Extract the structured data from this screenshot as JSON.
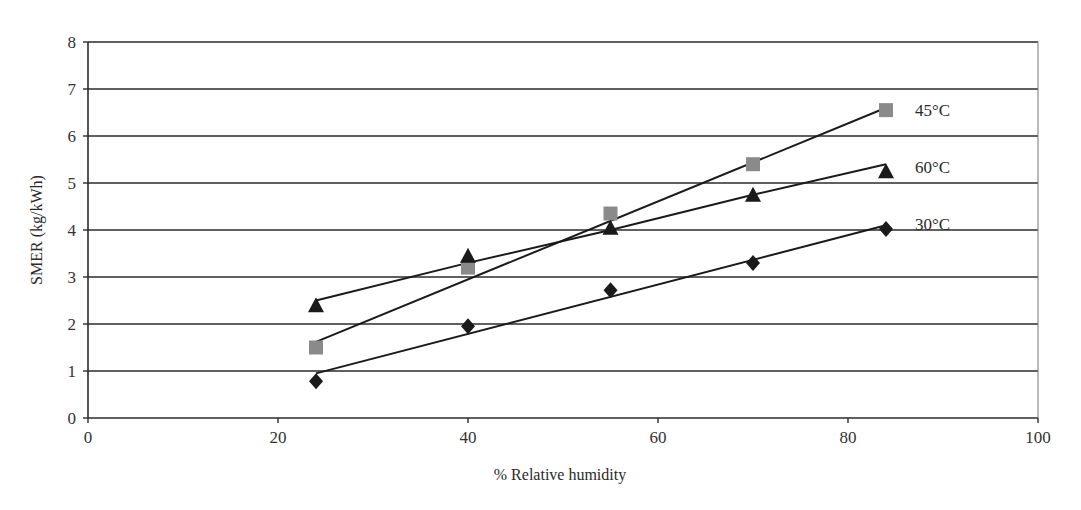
{
  "chart_data": {
    "type": "scatter",
    "title": "",
    "xlabel": "% Relative humidity",
    "ylabel": "SMER (kg/kWh)",
    "xlim": [
      0,
      100
    ],
    "ylim": [
      0,
      8
    ],
    "x_ticks": [
      0,
      20,
      40,
      60,
      80,
      100
    ],
    "y_ticks": [
      0,
      1,
      2,
      3,
      4,
      5,
      6,
      7,
      8
    ],
    "grid": "horizontal",
    "legend_position": "inline-right",
    "series": [
      {
        "name": "45°C",
        "marker": "square",
        "color": "#8a8a8a",
        "x": [
          24,
          40,
          55,
          70,
          84
        ],
        "y": [
          1.5,
          3.2,
          4.35,
          5.4,
          6.55
        ],
        "trendline": {
          "type": "linear",
          "x": [
            24,
            84
          ],
          "y": [
            1.62,
            6.6
          ]
        }
      },
      {
        "name": "60°C",
        "marker": "triangle",
        "color": "#1a1a1a",
        "x": [
          24,
          40,
          55,
          70,
          84
        ],
        "y": [
          2.4,
          3.45,
          4.05,
          4.75,
          5.25
        ],
        "trendline": {
          "type": "curve",
          "x": [
            24,
            40,
            55,
            70,
            84
          ],
          "y": [
            2.5,
            3.3,
            4.0,
            4.75,
            5.4
          ]
        }
      },
      {
        "name": "30°C",
        "marker": "diamond",
        "color": "#1a1a1a",
        "x": [
          24,
          40,
          55,
          70,
          84
        ],
        "y": [
          0.78,
          1.95,
          2.72,
          3.3,
          4.02
        ],
        "trendline": {
          "type": "linear",
          "x": [
            24,
            84
          ],
          "y": [
            0.95,
            4.1
          ]
        }
      }
    ]
  }
}
